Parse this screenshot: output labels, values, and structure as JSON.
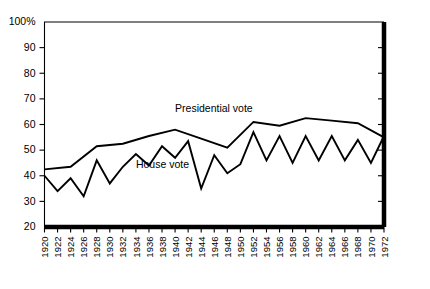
{
  "chart_data": {
    "type": "line",
    "title": "",
    "xlabel": "",
    "ylabel": "",
    "ylim": [
      20,
      100
    ],
    "xlim": [
      1920,
      1972
    ],
    "grid": false,
    "legend_position": "inline-annotations",
    "ytick_labels": [
      "100%",
      "90",
      "80",
      "70",
      "60",
      "50",
      "40",
      "30",
      "20"
    ],
    "ytick_values": [
      100,
      90,
      80,
      70,
      60,
      50,
      40,
      30,
      20
    ],
    "x": [
      1920,
      1922,
      1924,
      1926,
      1928,
      1930,
      1932,
      1934,
      1936,
      1938,
      1940,
      1942,
      1944,
      1946,
      1948,
      1950,
      1952,
      1954,
      1956,
      1958,
      1960,
      1962,
      1964,
      1966,
      1968,
      1970,
      1972
    ],
    "xtick_labels": [
      "1920",
      "1922",
      "1924",
      "1926",
      "1928",
      "1930",
      "1932",
      "1934",
      "1936",
      "1938",
      "1940",
      "1942",
      "1944",
      "1946",
      "1948",
      "1950",
      "1952",
      "1954",
      "1956",
      "1958",
      "1960",
      "1962",
      "1964",
      "1966",
      "1968",
      "1970",
      "1972"
    ],
    "series": [
      {
        "name": "Presidential vote",
        "label": "Presidential vote",
        "label_x": 1940,
        "label_y": 65,
        "x": [
          1920,
          1924,
          1928,
          1932,
          1936,
          1940,
          1944,
          1948,
          1952,
          1956,
          1960,
          1964,
          1968,
          1972
        ],
        "values": [
          42.5,
          43.5,
          51.5,
          52.5,
          55.5,
          58.0,
          54.5,
          51.0,
          61.0,
          59.5,
          62.5,
          61.5,
          60.5,
          55.0
        ]
      },
      {
        "name": "House vote",
        "label": "House vote",
        "label_x": 1934,
        "label_y": 43,
        "x": [
          1920,
          1922,
          1924,
          1926,
          1928,
          1930,
          1932,
          1934,
          1936,
          1938,
          1940,
          1942,
          1944,
          1946,
          1948,
          1950,
          1952,
          1954,
          1956,
          1958,
          1960,
          1962,
          1964,
          1966,
          1968,
          1970,
          1972
        ],
        "values": [
          40.0,
          34.0,
          39.0,
          32.0,
          46.0,
          37.0,
          43.5,
          48.5,
          44.0,
          51.5,
          47.0,
          53.5,
          35.0,
          48.0,
          41.0,
          44.5,
          57.0,
          46.0,
          55.5,
          45.0,
          55.5,
          46.0,
          55.5,
          46.0,
          54.0,
          45.0,
          55.5
        ]
      }
    ]
  },
  "axes": {
    "y_axis_name": "vote-percentage-axis",
    "x_axis_name": "election-year-axis"
  }
}
